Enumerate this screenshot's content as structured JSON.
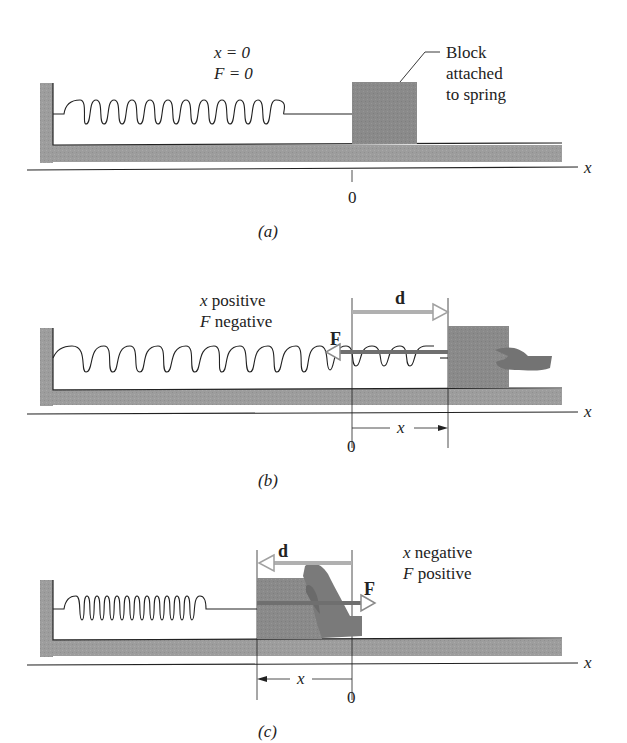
{
  "figure": {
    "colors": {
      "surface": "#9b9b9b",
      "block": "#8a8a8a",
      "line": "#222222",
      "arrow_outline": "#a8a8a8",
      "force_arrow": "#6f6f6f",
      "hand": "#7a7a7a"
    },
    "panels": [
      {
        "id": "a",
        "caption": "(a)",
        "state_line1": "x = 0",
        "state_line2": "F = 0",
        "callout_line1": "Block",
        "callout_line2": "attached",
        "callout_line3": "to spring",
        "axis_label": "x",
        "origin_label": "0"
      },
      {
        "id": "b",
        "caption": "(b)",
        "state_line1_var": "x",
        "state_line1_word": "positive",
        "state_line2_var": "F",
        "state_line2_word": "negative",
        "displacement_label": "d",
        "force_label": "F",
        "axis_label": "x",
        "origin_label": "0",
        "x_dimension_label": "x"
      },
      {
        "id": "c",
        "caption": "(c)",
        "state_line1_var": "x",
        "state_line1_word": "negative",
        "state_line2_var": "F",
        "state_line2_word": "positive",
        "displacement_label": "d",
        "force_label": "F",
        "axis_label": "x",
        "origin_label": "0",
        "x_dimension_label": "x"
      }
    ]
  }
}
